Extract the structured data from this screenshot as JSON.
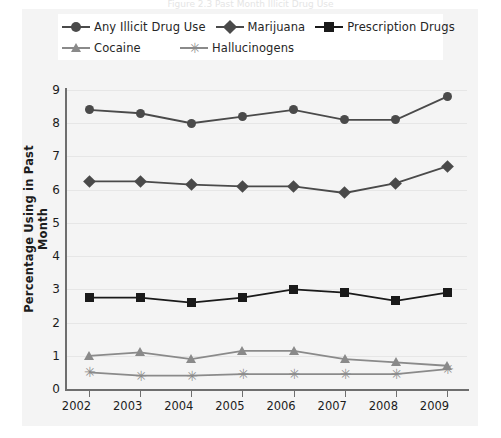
{
  "figure": {
    "top_caption_fragment": "Figure 2.3  Past Month Illicit Drug Use",
    "panel_background": "#f4f4f4"
  },
  "legend": {
    "rows": [
      [
        {
          "label": "Any Illicit Drug Use",
          "marker": "circle-marker",
          "color": "#4a4a4a"
        },
        {
          "label": "Marijuana",
          "marker": "diamond-marker",
          "color": "#4a4a4a"
        },
        {
          "label": "Prescription Drugs",
          "marker": "square-marker",
          "color": "#1a1a1a"
        }
      ],
      [
        {
          "label": "Cocaine",
          "marker": "triangle-marker",
          "color": "#8a8a8a"
        },
        {
          "label": "Hallucinogens",
          "marker": "star-marker",
          "color": "#8a8a8a"
        }
      ]
    ]
  },
  "yaxis": {
    "title": "Percentage Using in Past Month",
    "ticks": [
      "9",
      "8",
      "7",
      "6",
      "5",
      "4",
      "3",
      "2",
      "1",
      "0"
    ]
  },
  "xaxis": {
    "ticks": [
      "2002",
      "2003",
      "2004",
      "2005",
      "2006",
      "2007",
      "2008",
      "2009"
    ]
  },
  "chart_data": {
    "type": "line",
    "title": "",
    "xlabel": "",
    "ylabel": "Percentage Using in Past Month",
    "categories": [
      "2002",
      "2003",
      "2004",
      "2005",
      "2006",
      "2007",
      "2008",
      "2009"
    ],
    "ylim": [
      0,
      9
    ],
    "yticks": [
      0,
      1,
      2,
      3,
      4,
      5,
      6,
      7,
      8,
      9
    ],
    "grid": true,
    "legend_position": "top",
    "series": [
      {
        "name": "Any Illicit Drug Use",
        "marker": "circle",
        "color": "#4a4a4a",
        "values": [
          8.4,
          8.3,
          8.0,
          8.2,
          8.4,
          8.1,
          8.1,
          8.8
        ]
      },
      {
        "name": "Marijuana",
        "marker": "diamond",
        "color": "#4a4a4a",
        "values": [
          6.25,
          6.25,
          6.15,
          6.1,
          6.1,
          5.9,
          6.2,
          6.7
        ]
      },
      {
        "name": "Prescription Drugs",
        "marker": "square",
        "color": "#1a1a1a",
        "values": [
          2.75,
          2.75,
          2.6,
          2.75,
          3.0,
          2.9,
          2.65,
          2.9
        ]
      },
      {
        "name": "Cocaine",
        "marker": "triangle",
        "color": "#8a8a8a",
        "values": [
          1.0,
          1.1,
          0.9,
          1.15,
          1.15,
          0.9,
          0.8,
          0.7
        ]
      },
      {
        "name": "Hallucinogens",
        "marker": "star",
        "color": "#8a8a8a",
        "values": [
          0.5,
          0.4,
          0.4,
          0.45,
          0.45,
          0.45,
          0.45,
          0.6
        ]
      }
    ]
  }
}
